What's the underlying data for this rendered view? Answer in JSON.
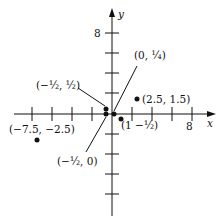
{
  "axes": {
    "x_label": "x",
    "y_label": "y",
    "x_tick_label": "8",
    "y_tick_label": "8"
  },
  "points": [
    {
      "label": "(2.5, 1.5)",
      "x": 2.5,
      "y": 1.5
    },
    {
      "label": "(-7.5, -2.5)",
      "x": -7.5,
      "y": -2.5
    },
    {
      "label": "(1, -1/2)",
      "x": 1,
      "y": -0.5
    },
    {
      "label": "(-1/2, 1/2)",
      "x": -0.5,
      "y": 0.5
    },
    {
      "label": "(-1/2, 0)",
      "x": -0.5,
      "y": 0
    },
    {
      "label": "(0, 1/4)",
      "x": 0,
      "y": 0.25
    }
  ],
  "labels": {
    "p1": "(2.5, 1.5)",
    "p2": "(−7.5, −2.5)"
  }
}
